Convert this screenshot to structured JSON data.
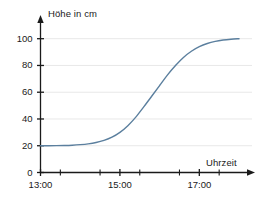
{
  "chart_data": {
    "type": "line",
    "title": "",
    "xlabel": "Uhrzeit",
    "ylabel": "Höhe in cm",
    "xtick_labels": [
      "13:00",
      "15:00",
      "17:00"
    ],
    "xtick_values": [
      13,
      15,
      17
    ],
    "minor_xtick_values": [
      13.5,
      14,
      14.5,
      15.5,
      16,
      16.5,
      17.5
    ],
    "ytick_labels": [
      "0",
      "20",
      "40",
      "60",
      "80",
      "100"
    ],
    "ytick_values": [
      0,
      20,
      40,
      60,
      80,
      100
    ],
    "xlim": [
      13,
      18.1
    ],
    "ylim": [
      0,
      108
    ],
    "grid": "horizontal",
    "legend": "none",
    "line_color": "#5b7f9e",
    "axis_color": "#1a1a1a",
    "grid_color": "#e8e8e8",
    "series": [
      {
        "name": "Höhe",
        "x": [
          13.0,
          13.2,
          13.4,
          13.6,
          13.8,
          14.0,
          14.2,
          14.4,
          14.6,
          14.8,
          15.0,
          15.2,
          15.4,
          15.6,
          15.8,
          16.0,
          16.2,
          16.4,
          16.6,
          16.8,
          17.0,
          17.2,
          17.4,
          17.6,
          17.8,
          18.0
        ],
        "y": [
          20.0,
          20.0,
          20.1,
          20.2,
          20.4,
          20.8,
          21.4,
          22.4,
          24.0,
          26.4,
          30.0,
          35.0,
          41.4,
          49.0,
          57.0,
          65.0,
          73.0,
          80.0,
          86.0,
          90.6,
          94.0,
          96.4,
          98.0,
          99.0,
          99.6,
          100.0
        ]
      }
    ]
  }
}
